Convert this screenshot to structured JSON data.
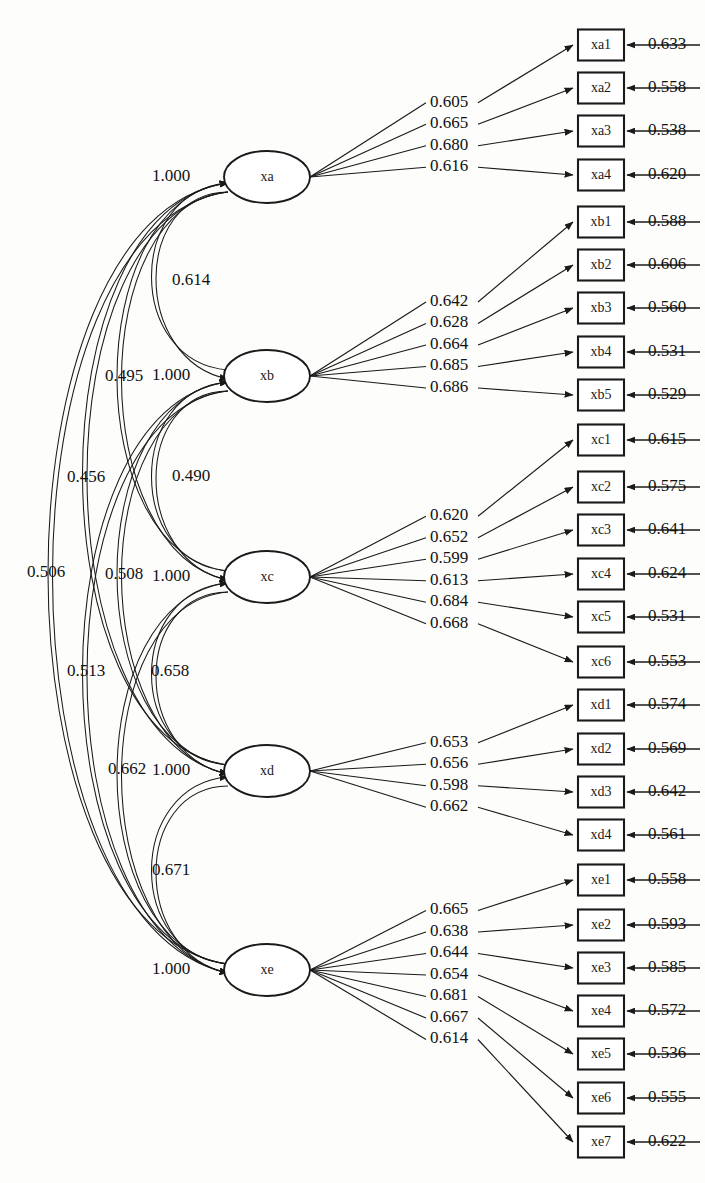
{
  "diagram": {
    "type": "sem-path-diagram",
    "title": "",
    "factor_variance_label": "1.000",
    "factors": [
      {
        "id": "xa",
        "label": "xa",
        "variance": "1.000",
        "cx": 267,
        "cy": 177,
        "rx": 43,
        "ry": 26,
        "indicators": [
          {
            "label": "xa1",
            "loading": "0.605",
            "residual": "0.633",
            "y": 45
          },
          {
            "label": "xa2",
            "loading": "0.665",
            "residual": "0.558",
            "y": 88
          },
          {
            "label": "xa3",
            "loading": "0.680",
            "residual": "0.538",
            "y": 131
          },
          {
            "label": "xa4",
            "loading": "0.616",
            "residual": "0.620",
            "y": 175
          }
        ]
      },
      {
        "id": "xb",
        "label": "xb",
        "variance": "1.000",
        "cx": 267,
        "cy": 376,
        "rx": 43,
        "ry": 26,
        "indicators": [
          {
            "label": "xb1",
            "loading": "0.642",
            "residual": "0.588",
            "y": 222
          },
          {
            "label": "xb2",
            "loading": "0.628",
            "residual": "0.606",
            "y": 265
          },
          {
            "label": "xb3",
            "loading": "0.664",
            "residual": "0.560",
            "y": 308
          },
          {
            "label": "xb4",
            "loading": "0.685",
            "residual": "0.531",
            "y": 352
          },
          {
            "label": "xb5",
            "loading": "0.686",
            "residual": "0.529",
            "y": 395
          }
        ]
      },
      {
        "id": "xc",
        "label": "xc",
        "variance": "1.000",
        "cx": 267,
        "cy": 577,
        "rx": 43,
        "ry": 26,
        "indicators": [
          {
            "label": "xc1",
            "loading": "0.620",
            "residual": "0.615",
            "y": 440
          },
          {
            "label": "xc2",
            "loading": "0.652",
            "residual": "0.575",
            "y": 487
          },
          {
            "label": "xc3",
            "loading": "0.599",
            "residual": "0.641",
            "y": 530
          },
          {
            "label": "xc4",
            "loading": "0.613",
            "residual": "0.624",
            "y": 574
          },
          {
            "label": "xc5",
            "loading": "0.684",
            "residual": "0.531",
            "y": 617
          },
          {
            "label": "xc6",
            "loading": "0.668",
            "residual": "0.553",
            "y": 662
          }
        ]
      },
      {
        "id": "xd",
        "label": "xd",
        "variance": "1.000",
        "cx": 267,
        "cy": 771,
        "rx": 43,
        "ry": 26,
        "indicators": [
          {
            "label": "xd1",
            "loading": "0.653",
            "residual": "0.574",
            "y": 705
          },
          {
            "label": "xd2",
            "loading": "0.656",
            "residual": "0.569",
            "y": 749
          },
          {
            "label": "xd3",
            "loading": "0.598",
            "residual": "0.642",
            "y": 792
          },
          {
            "label": "xd4",
            "loading": "0.662",
            "residual": "0.561",
            "y": 835
          }
        ]
      },
      {
        "id": "xe",
        "label": "xe",
        "variance": "1.000",
        "cx": 267,
        "cy": 970,
        "rx": 43,
        "ry": 26,
        "indicators": [
          {
            "label": "xe1",
            "loading": "0.665",
            "residual": "0.558",
            "y": 880
          },
          {
            "label": "xe2",
            "loading": "0.638",
            "residual": "0.593",
            "y": 925
          },
          {
            "label": "xe3",
            "loading": "0.644",
            "residual": "0.585",
            "y": 968
          },
          {
            "label": "xe4",
            "loading": "0.654",
            "residual": "0.572",
            "y": 1011
          },
          {
            "label": "xe5",
            "loading": "0.681",
            "residual": "0.536",
            "y": 1054
          },
          {
            "label": "xe6",
            "loading": "0.667",
            "residual": "0.555",
            "y": 1098
          },
          {
            "label": "xe7",
            "loading": "0.614",
            "residual": "0.622",
            "y": 1142
          }
        ]
      }
    ],
    "correlations": [
      {
        "from": "xa",
        "to": "xb",
        "value": "0.614",
        "x": 172,
        "y": 281
      },
      {
        "from": "xa",
        "to": "xc",
        "value": "0.495",
        "x": 105,
        "y": 377
      },
      {
        "from": "xa",
        "to": "xd",
        "value": "0.456",
        "x": 67,
        "y": 478
      },
      {
        "from": "xa",
        "to": "xe",
        "value": "0.506",
        "x": 27,
        "y": 573
      },
      {
        "from": "xb",
        "to": "xc",
        "value": "0.490",
        "x": 172,
        "y": 477
      },
      {
        "from": "xb",
        "to": "xd",
        "value": "0.508",
        "x": 105,
        "y": 575
      },
      {
        "from": "xb",
        "to": "xe",
        "value": "0.513",
        "x": 67,
        "y": 672
      },
      {
        "from": "xc",
        "to": "xd",
        "value": "0.658",
        "x": 151,
        "y": 672
      },
      {
        "from": "xc",
        "to": "xe",
        "value": "0.662",
        "x": 108,
        "y": 770
      },
      {
        "from": "xd",
        "to": "xe",
        "value": "0.671",
        "x": 152,
        "y": 871
      }
    ]
  }
}
